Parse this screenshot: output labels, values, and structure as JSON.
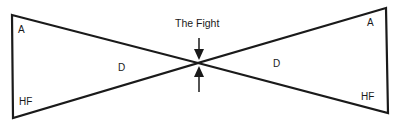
{
  "diagram": {
    "title": "The Fight",
    "left_triangle": {
      "top_label": "A",
      "middle_label": "D",
      "bottom_label": "HF"
    },
    "right_triangle": {
      "top_label": "A",
      "middle_label": "D",
      "bottom_label": "HF"
    },
    "colors": {
      "line": "#1a1a1a",
      "background": "#ffffff"
    }
  }
}
